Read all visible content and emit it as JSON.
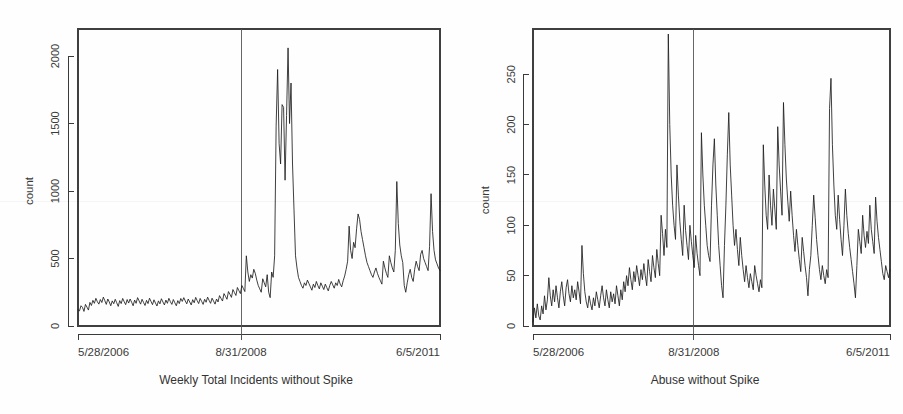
{
  "image": {
    "width": 903,
    "height": 414,
    "background_color": "#fefefe",
    "ink_color": "#1d1d1d"
  },
  "panels": [
    {
      "id": "left",
      "caption": "Weekly Total Incidents without Spike"
    },
    {
      "id": "right",
      "caption": "Abuse without Spike"
    }
  ],
  "chart_data": [
    {
      "type": "line",
      "title": "",
      "caption": "Weekly Total Incidents without Spike",
      "xlabel": "Weekly Total Incidents without Spike",
      "ylabel": "count",
      "grid": false,
      "legend": "none",
      "x_tick_labels": [
        "5/28/2006",
        "8/31/2008",
        "6/5/2011"
      ],
      "x_tick_positions": [
        0,
        118,
        262
      ],
      "y_ticks": [
        0,
        500,
        1000,
        1500,
        2000
      ],
      "ylim": [
        0,
        2200
      ],
      "xlim": [
        0,
        262
      ],
      "annotations": [
        {
          "type": "vertical-line",
          "x": 118,
          "label": "8/31/2008"
        }
      ],
      "series": [
        {
          "name": "Weekly total incidents",
          "values": [
            120,
            112,
            150,
            138,
            108,
            160,
            140,
            118,
            175,
            152,
            190,
            168,
            205,
            180,
            162,
            196,
            174,
            214,
            188,
            160,
            200,
            178,
            150,
            186,
            165,
            198,
            172,
            145,
            188,
            166,
            204,
            180,
            158,
            196,
            170,
            200,
            176,
            150,
            192,
            168,
            210,
            186,
            162,
            198,
            174,
            152,
            190,
            166,
            206,
            182,
            158,
            194,
            170,
            148,
            186,
            164,
            202,
            178,
            156,
            192,
            168,
            205,
            180,
            160,
            196,
            172,
            150,
            188,
            166,
            204,
            182,
            210,
            186,
            164,
            200,
            178,
            156,
            195,
            172,
            212,
            188,
            166,
            204,
            182,
            160,
            198,
            176,
            214,
            190,
            168,
            206,
            184,
            162,
            200,
            178,
            225,
            205,
            185,
            240,
            220,
            198,
            255,
            235,
            212,
            270,
            248,
            226,
            285,
            262,
            240,
            300,
            278,
            255,
            520,
            400,
            330,
            380,
            355,
            420,
            390,
            340,
            300,
            275,
            250,
            350,
            320,
            290,
            380,
            250,
            210,
            400,
            360,
            520,
            1480,
            1900,
            1350,
            1200,
            1640,
            1620,
            1080,
            1560,
            2060,
            1500,
            1800,
            1200,
            860,
            520,
            430,
            360,
            330,
            300,
            280,
            320,
            300,
            340,
            315,
            290,
            265,
            310,
            285,
            330,
            300,
            275,
            320,
            295,
            270,
            310,
            285,
            260,
            300,
            330,
            305,
            280,
            320,
            300,
            345,
            310,
            290,
            335,
            370,
            420,
            480,
            740,
            560,
            500,
            620,
            580,
            720,
            830,
            790,
            700,
            640,
            580,
            520,
            470,
            440,
            410,
            380,
            360,
            400,
            430,
            390,
            360,
            335,
            310,
            480,
            430,
            390,
            360,
            520,
            470,
            430,
            400,
            560,
            1070,
            760,
            600,
            520,
            470,
            300,
            250,
            320,
            380,
            420,
            360,
            330,
            420,
            480,
            440,
            410,
            530,
            560,
            500,
            470,
            440,
            410,
            590,
            980,
            700,
            560,
            490,
            460,
            430,
            410
          ]
        }
      ]
    },
    {
      "type": "line",
      "title": "",
      "caption": "Abuse without Spike",
      "xlabel": "Abuse without Spike",
      "ylabel": "count",
      "grid": false,
      "legend": "none",
      "x_tick_labels": [
        "5/28/2006",
        "8/31/2008",
        "6/5/2011"
      ],
      "x_tick_positions": [
        0,
        118,
        262
      ],
      "y_ticks": [
        0,
        50,
        100,
        150,
        200,
        250
      ],
      "ylim": [
        0,
        295
      ],
      "xlim": [
        0,
        262
      ],
      "annotations": [
        {
          "type": "vertical-line",
          "x": 118,
          "label": "8/31/2008"
        }
      ],
      "series": [
        {
          "name": "Abuse incidents",
          "values": [
            4,
            18,
            8,
            22,
            10,
            6,
            20,
            12,
            30,
            16,
            26,
            48,
            30,
            20,
            36,
            24,
            40,
            28,
            18,
            34,
            44,
            30,
            20,
            38,
            46,
            32,
            24,
            40,
            28,
            36,
            26,
            44,
            34,
            22,
            80,
            52,
            34,
            24,
            18,
            30,
            22,
            16,
            28,
            20,
            34,
            26,
            18,
            30,
            40,
            28,
            20,
            36,
            26,
            18,
            34,
            24,
            32,
            22,
            40,
            30,
            20,
            36,
            26,
            44,
            34,
            50,
            40,
            58,
            46,
            36,
            54,
            44,
            60,
            50,
            40,
            56,
            46,
            62,
            50,
            40,
            66,
            54,
            44,
            70,
            58,
            48,
            76,
            62,
            50,
            110,
            92,
            70,
            96,
            78,
            290,
            200,
            150,
            120,
            100,
            86,
            160,
            130,
            104,
            86,
            70,
            120,
            95,
            80,
            66,
            100,
            84,
            70,
            58,
            90,
            72,
            60,
            50,
            192,
            150,
            120,
            100,
            80,
            70,
            64,
            120,
            160,
            186,
            140,
            110,
            80,
            60,
            40,
            28,
            80,
            120,
            170,
            212,
            160,
            130,
            100,
            80,
            96,
            76,
            60,
            88,
            70,
            56,
            44,
            60,
            48,
            38,
            52,
            44,
            36,
            60,
            50,
            42,
            34,
            46,
            38,
            180,
            140,
            110,
            96,
            150,
            120,
            100,
            136,
            116,
            96,
            198,
            160,
            134,
            110,
            222,
            180,
            146,
            124,
            104,
            134,
            110,
            90,
            74,
            96,
            80,
            66,
            54,
            88,
            74,
            60,
            48,
            30,
            56,
            70,
            100,
            130,
            108,
            86,
            70,
            56,
            46,
            60,
            50,
            42,
            56,
            48,
            216,
            246,
            180,
            140,
            110,
            96,
            130,
            106,
            86,
            70,
            100,
            136,
            110,
            92,
            78,
            66,
            54,
            42,
            28,
            60,
            96,
            84,
            72,
            110,
            90,
            78,
            94,
            82,
            120,
            96,
            84,
            72,
            128,
            104,
            88,
            76,
            64,
            52,
            46,
            60,
            54,
            48,
            56
          ]
        }
      ]
    }
  ]
}
